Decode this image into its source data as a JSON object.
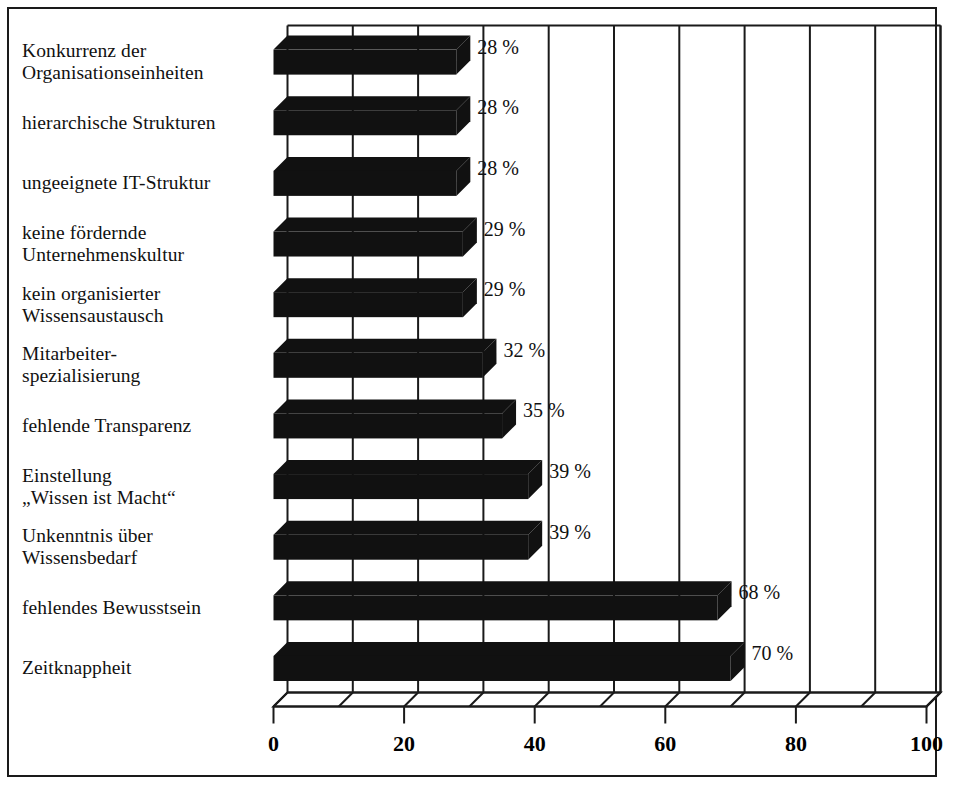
{
  "chart_data": {
    "type": "bar",
    "orientation": "horizontal",
    "style": "3d",
    "title": "",
    "subtitle": "",
    "xlabel": "",
    "ylabel": "",
    "xlim": [
      0,
      100
    ],
    "grid": true,
    "legend": null,
    "unit": "%",
    "categories": [
      "Konkurrenz der\nOrganisationseinheiten",
      "hierarchische Strukturen",
      "ungeeignete IT-Struktur",
      "keine fördernde\nUnternehmenskultur",
      "kein organisierter\nWissensaustausch",
      "Mitarbeiter-\nspezialisierung",
      "fehlende Transparenz",
      "Einstellung\n„Wissen ist Macht“",
      "Unkenntnis über\nWissensbedarf",
      "fehlendes Bewusstsein",
      "Zeitknappheit"
    ],
    "values": [
      28,
      28,
      28,
      29,
      29,
      32,
      35,
      39,
      39,
      68,
      70
    ],
    "value_labels": [
      "28 %",
      "28 %",
      "28 %",
      "29 %",
      "29 %",
      "32 %",
      "35 %",
      "39 %",
      "39 %",
      "68 %",
      "70 %"
    ],
    "x_ticks": [
      0,
      20,
      40,
      60,
      80,
      100
    ],
    "x_tick_labels": [
      "0",
      "20",
      "40",
      "60",
      "80",
      "100"
    ],
    "gridline_values": [
      0,
      10,
      20,
      30,
      40,
      50,
      60,
      70,
      80,
      90,
      100
    ],
    "bar_color": "#111111",
    "grid_color": "#1a1a1a",
    "frame_color": "#1a1a1a",
    "background_color": "#ffffff"
  }
}
